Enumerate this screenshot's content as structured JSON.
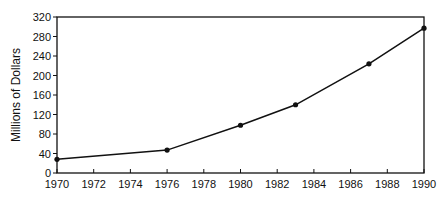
{
  "chart_data": {
    "type": "line",
    "title": "",
    "xlabel": "",
    "ylabel": "Millions of Dollars",
    "x": [
      1970,
      1976,
      1980,
      1983,
      1987,
      1990
    ],
    "series": [
      {
        "name": "Millions of Dollars",
        "values": [
          28,
          47,
          98,
          140,
          224,
          297
        ]
      }
    ],
    "xlim": [
      1970,
      1990
    ],
    "ylim": [
      0,
      320
    ],
    "x_ticks": [
      "1970",
      "1972",
      "1974",
      "1976",
      "1978",
      "1980",
      "1982",
      "1984",
      "1986",
      "1988",
      "1990"
    ],
    "y_ticks": [
      "0",
      "40",
      "80",
      "120",
      "160",
      "200",
      "240",
      "280",
      "320"
    ],
    "grid": false,
    "legend": null,
    "markers": "filled-circle",
    "line_color": "#111111"
  }
}
